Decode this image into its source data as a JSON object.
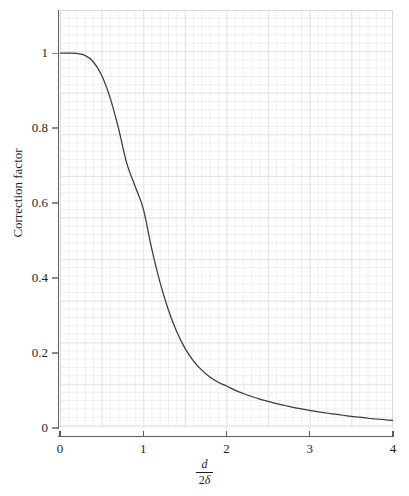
{
  "chart_data": {
    "type": "line",
    "title": "",
    "subtitle": "",
    "xlabel_numerator": "d",
    "xlabel_denominator_coefficient": "2",
    "xlabel_denominator_symbol": "δ",
    "ylabel": "Correction factor",
    "xlim": [
      0,
      4
    ],
    "ylim": [
      0,
      1.115
    ],
    "grid": true,
    "grid_minor_step_x": 0.1,
    "grid_minor_step_y": 0.025,
    "grid_major_step_x": 0.5,
    "grid_major_step_y": 0.125,
    "legend": null,
    "legend_position": "none",
    "x_ticks": [
      {
        "value": 0,
        "label": "0"
      },
      {
        "value": 1,
        "label": "1"
      },
      {
        "value": 2,
        "label": "2"
      },
      {
        "value": 3,
        "label": "3"
      },
      {
        "value": 4,
        "label": "4"
      }
    ],
    "y_ticks": [
      {
        "value": 0,
        "label": "0"
      },
      {
        "value": 0.2,
        "label": "0.2"
      },
      {
        "value": 0.4,
        "label": "0.4"
      },
      {
        "value": 0.6,
        "label": "0.6"
      },
      {
        "value": 0.8,
        "label": "0.8"
      },
      {
        "value": 1,
        "label": "1"
      }
    ],
    "series": [
      {
        "name": "Correction factor",
        "color": "#3a3a3a",
        "x": [
          0.0,
          0.1,
          0.2,
          0.3,
          0.4,
          0.5,
          0.6,
          0.7,
          0.8,
          0.9,
          1.0,
          1.1,
          1.2,
          1.3,
          1.4,
          1.5,
          1.6,
          1.7,
          1.8,
          1.9,
          2.0,
          2.1,
          2.2,
          2.3,
          2.4,
          2.5,
          2.6,
          2.7,
          2.8,
          2.9,
          3.0,
          3.1,
          3.2,
          3.3,
          3.4,
          3.5,
          3.6,
          3.7,
          3.8,
          3.9,
          4.0
        ],
        "y": [
          1.0,
          1.0,
          0.999,
          0.994,
          0.977,
          0.941,
          0.882,
          0.802,
          0.708,
          0.646,
          0.585,
          0.48,
          0.39,
          0.316,
          0.258,
          0.213,
          0.18,
          0.155,
          0.136,
          0.122,
          0.112,
          0.101,
          0.092,
          0.084,
          0.077,
          0.071,
          0.065,
          0.06,
          0.055,
          0.051,
          0.047,
          0.043,
          0.04,
          0.037,
          0.034,
          0.031,
          0.029,
          0.026,
          0.024,
          0.022,
          0.02
        ]
      }
    ],
    "colors": {
      "curve": "#3a3a3a",
      "axis": "#5b5b5b",
      "grid_minor": "#eceef3",
      "grid_major": "#e2e5ec",
      "text": "#1e1e1e",
      "background": "#ffffff"
    }
  }
}
